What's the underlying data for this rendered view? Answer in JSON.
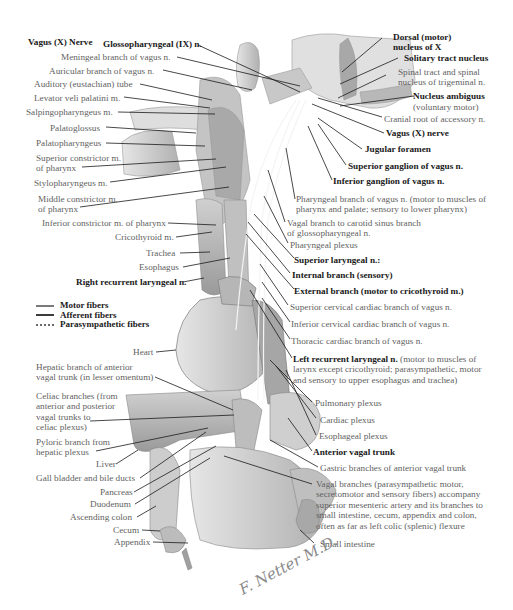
{
  "title": "Vagus (X) Nerve",
  "left_labels": {
    "glossopharyngeal": "Glossopharyngeal (IX) n.",
    "meningeal": "Meningeal branch of vagus n.",
    "auricular": "Auricular branch of vagus n.",
    "auditory_tube": "Auditory (eustachian) tube",
    "levator": "Levator veli palatini m.",
    "salpingo": "Salpingopharyngeus m.",
    "palatoglossus": "Palatoglossus",
    "palatopharyngeus": "Palatopharyngeus",
    "sup_constrictor_1": "Superior constrictor m.",
    "sup_constrictor_2": "of pharynx",
    "stylopharyngeus": "Stylopharyngeus m.",
    "mid_constrictor_1": "Middle constrictor m.",
    "mid_constrictor_2": "of pharynx",
    "inf_constrictor": "Inferior constrictor m. of pharynx",
    "cricothyroid": "Cricothyroid m.",
    "trachea": "Trachea",
    "esophagus": "Esophagus",
    "right_recurrent": "Right recurrent laryngeal n.",
    "heart": "Heart",
    "hepatic_1": "Hepatic branch of anterior",
    "hepatic_2": "vagal trunk (in lesser omentum)",
    "celiac_1": "Celiac branches (from",
    "celiac_2": "anterior and posterior",
    "celiac_3": "vagal trunks to",
    "celiac_4": "celiac plexus)",
    "pyloric_1": "Pyloric branch from",
    "pyloric_2": "hepatic plexus",
    "liver": "Liver",
    "gall_bladder": "Gall bladder and bile ducts",
    "pancreas": "Pancreas",
    "duodenum": "Duodenum",
    "ascending_colon": "Ascending colon",
    "cecum": "Cecum",
    "appendix": "Appendix"
  },
  "right_labels": {
    "dorsal_1": "Dorsal (motor)",
    "dorsal_2": "nucleus of X",
    "solitary": "Solitary tract nucleus",
    "spinal_1": "Spinal tract and spinal",
    "spinal_2": "nucleus of trigeminal n.",
    "ambiguus_1": "Nucleus ambiguus",
    "ambiguus_2": "(voluntary motor)",
    "cranial_root": "Cranial root of accessory n.",
    "vagus_nerve": "Vagus (X) nerve",
    "jugular": "Jugular foramen",
    "sup_ganglion": "Superior ganglion of vagus n.",
    "inf_ganglion": "Inferior ganglion of vagus n.",
    "pharyngeal_branch_1": "Pharyngeal branch of vagus n. (motor to muscles of",
    "pharyngeal_branch_2": "pharynx and palate; sensory to lower pharynx)",
    "carotid_1": "Vagal branch to carotid sinus branch",
    "carotid_2": "of glossopharyngeal n.",
    "pharyngeal_plexus": "Pharyngeal plexus",
    "sup_laryngeal": "Superior laryngeal n.:",
    "internal_branch": "Internal branch (sensory)",
    "external_branch": "External branch (motor to cricothyroid m.)",
    "sup_cervical_cardiac": "Superior cervical cardiac branch of vagus n.",
    "inf_cervical_cardiac": "Inferior cervical cardiac branch of vagus n.",
    "thoracic_cardiac": "Thoracic cardiac branch of vagus n.",
    "left_recurrent_bold": "Left recurrent laryngeal n.",
    "left_recurrent_1": " (motor to muscles of",
    "left_recurrent_2": "larynx except cricothyroid; parasympathetic, motor",
    "left_recurrent_3": "and sensory to upper esophagus and trachea)",
    "pulmonary": "Pulmonary plexus",
    "cardiac": "Cardiac plexus",
    "esophageal": "Esophageal plexus",
    "anterior_trunk": "Anterior vagal trunk",
    "gastric": "Gastric branches of anterior vagal trunk",
    "vagal_branches_1": "Vagal branches (parasympathetic motor,",
    "vagal_branches_2": "secretomotor and sensory fibers) accompany",
    "vagal_branches_3": "superior mesenteric artery and its branches to",
    "vagal_branches_4": "small intestine, cecum, appendix and colon,",
    "vagal_branches_5": "often as far as left colic (splenic) flexure",
    "small_intestine": "Small intestine"
  },
  "legend": {
    "motor": "Motor fibers",
    "afferent": "Afferent fibers",
    "parasympathetic": "Parasympathetic fibers"
  },
  "signature": "F. Netter M.D.",
  "colors": {
    "leader": "#1a1a1a",
    "tissue_light": "#dcdcdc",
    "tissue_mid": "#b4b4b4",
    "tissue_dark": "#8c8c8c"
  }
}
